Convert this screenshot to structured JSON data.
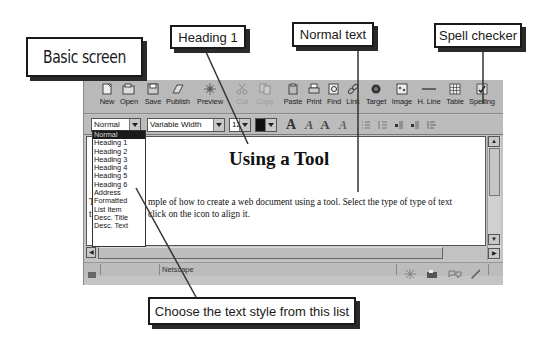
{
  "callouts": {
    "basic_screen": "Basic screen",
    "heading_1": "Heading 1",
    "normal_text": "Normal text",
    "spell_checker": "Spell checker",
    "choose_style": "Choose the text style from this list"
  },
  "toolbar": {
    "buttons": [
      {
        "label": "New",
        "icon": "new-document-icon",
        "enabled": true
      },
      {
        "label": "Open",
        "icon": "open-folder-icon",
        "enabled": true
      },
      {
        "label": "Save",
        "icon": "save-disk-icon",
        "enabled": true
      },
      {
        "label": "Publish",
        "icon": "publish-icon",
        "enabled": true
      },
      {
        "label": "Preview",
        "icon": "preview-icon",
        "enabled": true
      },
      {
        "label": "Cut",
        "icon": "cut-icon",
        "enabled": false
      },
      {
        "label": "Copy",
        "icon": "copy-icon",
        "enabled": false
      },
      {
        "label": "Paste",
        "icon": "paste-icon",
        "enabled": true
      },
      {
        "label": "Print",
        "icon": "print-icon",
        "enabled": true
      },
      {
        "label": "Find",
        "icon": "find-icon",
        "enabled": true
      },
      {
        "label": "Link",
        "icon": "link-icon",
        "enabled": true
      },
      {
        "label": "Target",
        "icon": "target-icon",
        "enabled": true
      },
      {
        "label": "Image",
        "icon": "image-icon",
        "enabled": true
      },
      {
        "label": "H. Line",
        "icon": "horizontal-line-icon",
        "enabled": true
      },
      {
        "label": "Table",
        "icon": "table-icon",
        "enabled": true
      },
      {
        "label": "Spelling",
        "icon": "spelling-icon",
        "enabled": true
      }
    ]
  },
  "format_bar": {
    "paragraph_style": "Normal",
    "font_face": "Variable Width",
    "font_size": "12",
    "text_color": "#111111",
    "style_buttons": [
      "A",
      "A",
      "A",
      "A"
    ],
    "list_align_icons": [
      "bullet-list-icon",
      "numbered-list-icon",
      "decrease-indent-icon",
      "increase-indent-icon",
      "align-icon"
    ]
  },
  "style_dropdown": {
    "selected_index": 0,
    "options": [
      "Normal",
      "Heading 1",
      "Heading 2",
      "Heading 3",
      "Heading 4",
      "Heading 5",
      "Heading 6",
      "Address",
      "Formatted",
      "List Item",
      "Desc. Title",
      "Desc. Text"
    ]
  },
  "document": {
    "heading": "Using a Tool",
    "line1_prefix": "T",
    "line1": "mple of how to create a web document using a tool. Select the type of type of text",
    "line2_prefix": "t",
    "line2": "click on the icon to align it."
  },
  "status_bar": {
    "text": "Netscape"
  }
}
